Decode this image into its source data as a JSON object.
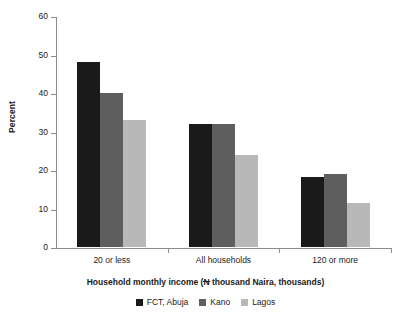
{
  "chart_data": {
    "type": "bar",
    "title": "",
    "subtitle": "",
    "xlabel": "Household monthly income (N thousand Naira, thousands)",
    "xlabel_prefix": "Household monthly income (",
    "xlabel_currency_symbol": "N",
    "xlabel_suffix": " thousand Naira, thousands)",
    "ylabel": "Percent",
    "ylim": [
      0,
      60
    ],
    "y_ticks": [
      60,
      50,
      40,
      30,
      20,
      10,
      0
    ],
    "y_tick_labels": [
      "60",
      "50",
      "40",
      "30",
      "20",
      "10",
      "0"
    ],
    "grid": false,
    "legend_position": "bottom-center",
    "categories": [
      "20 or less",
      "All households",
      "120 or more"
    ],
    "series": [
      {
        "name": "FCT, Abuja",
        "color": "#1a1a1a",
        "values": [
          48,
          32,
          18.3
        ]
      },
      {
        "name": "Kano",
        "color": "#5e5e5e",
        "values": [
          40,
          32,
          19
        ]
      },
      {
        "name": "Lagos",
        "color": "#b8b8b8",
        "values": [
          33,
          24,
          11.5
        ]
      }
    ]
  },
  "axis_color": "#8c8c8c",
  "text_color": "#1a1a1a",
  "background_color": "#ffffff"
}
